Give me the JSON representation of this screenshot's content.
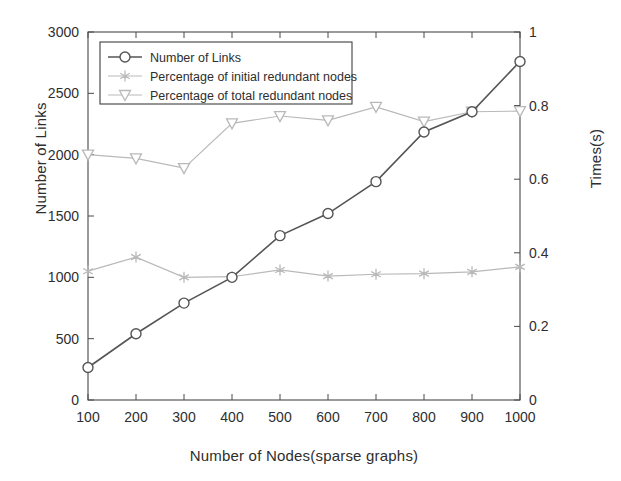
{
  "chart_data": {
    "type": "line",
    "title": "",
    "xlabel": "Number of Nodes(sparse graphs)",
    "ylabel": "Number of Links",
    "ylabel_right": "Times(s)",
    "x": [
      100,
      200,
      300,
      400,
      500,
      600,
      700,
      800,
      900,
      1000
    ],
    "xlim": [
      100,
      1000
    ],
    "ylim": [
      0,
      3000
    ],
    "ylim_right": [
      0,
      1
    ],
    "xticks": [
      "100",
      "200",
      "300",
      "400",
      "500",
      "600",
      "700",
      "800",
      "900",
      "1000"
    ],
    "yticks_left": [
      "0",
      "500",
      "1000",
      "1500",
      "2000",
      "2500",
      "3000"
    ],
    "yticks_right": [
      "0",
      "0.2",
      "0.4",
      "0.6",
      "0.8",
      "1"
    ],
    "grid": false,
    "legend_position": "upper left",
    "series": [
      {
        "name": "Number of Links",
        "axis": "left",
        "marker": "circle",
        "color": "#555555",
        "values": [
          265,
          540,
          790,
          1000,
          1340,
          1520,
          1780,
          2185,
          2350,
          2760
        ]
      },
      {
        "name": "Percentage of initial redundant nodes",
        "axis": "right",
        "marker": "star",
        "color": "#b9b9b9",
        "values_left_scale": [
          1050,
          1165,
          1000,
          1005,
          1060,
          1010,
          1025,
          1030,
          1045,
          1085
        ],
        "values": [
          0.35,
          0.388,
          0.333,
          0.335,
          0.353,
          0.337,
          0.342,
          0.343,
          0.348,
          0.362
        ]
      },
      {
        "name": "Percentage of total redundant nodes",
        "axis": "right",
        "marker": "triangle-down",
        "color": "#b9b9b9",
        "values_left_scale": [
          2000,
          1970,
          1890,
          2255,
          2315,
          2280,
          2390,
          2270,
          2350,
          2355
        ],
        "values": [
          0.667,
          0.657,
          0.63,
          0.752,
          0.772,
          0.76,
          0.797,
          0.757,
          0.783,
          0.785
        ]
      }
    ]
  },
  "legend": {
    "items": [
      {
        "label": "Number of Links",
        "marker": "circle-marker"
      },
      {
        "label": "Percentage of initial redundant nodes",
        "marker": "star-marker"
      },
      {
        "label": "Percentage of total redundant nodes",
        "marker": "triangle-down-marker"
      }
    ]
  },
  "axes": {
    "x_title": "Number of Nodes(sparse graphs)",
    "y_left_title": "Number of Links",
    "y_right_title": "Times(s)"
  },
  "colors": {
    "primary_series": "#555555",
    "secondary_series": "#b9b9b9",
    "frame": "#4a4a4a",
    "background": "#ffffff"
  }
}
